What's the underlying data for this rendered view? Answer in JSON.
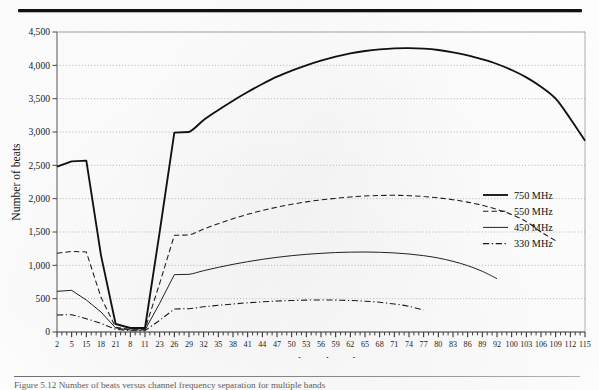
{
  "page": {
    "caption_text": "Figure 5.12 Number of beats versus channel frequency separation for multiple bands"
  },
  "chart_data": {
    "type": "line",
    "title": "",
    "xlabel": "Channel number",
    "ylabel": "Number of beats",
    "ylim": [
      0,
      4500
    ],
    "ytick_labels": [
      "0",
      "500",
      "1,000",
      "1,500",
      "2,000",
      "2,500",
      "3,000",
      "3,500",
      "4,000",
      "4,500"
    ],
    "ytick_values": [
      0,
      500,
      1000,
      1500,
      2000,
      2500,
      3000,
      3500,
      4000,
      4500
    ],
    "grid": "horizontal-dotted",
    "legend_position": "right-middle",
    "xtick_labels": [
      "2",
      "5",
      "15",
      "18",
      "21",
      "8",
      "11",
      "23",
      "26",
      "29",
      "32",
      "35",
      "38",
      "41",
      "44",
      "47",
      "50",
      "53",
      "56",
      "59",
      "62",
      "65",
      "68",
      "71",
      "74",
      "77",
      "80",
      "83",
      "86",
      "89",
      "92",
      "100",
      "103",
      "106",
      "109",
      "112",
      "115"
    ],
    "series": [
      {
        "name": "750 MHz",
        "style": "solid-thick",
        "color": "#111111",
        "points": [
          [
            0,
            2480
          ],
          [
            1,
            2560
          ],
          [
            2,
            2570
          ],
          [
            3,
            1150
          ],
          [
            4,
            120
          ],
          [
            5,
            60
          ],
          [
            6,
            60
          ],
          [
            7,
            1500
          ],
          [
            8,
            2990
          ],
          [
            9,
            3000
          ],
          [
            10,
            3180
          ],
          [
            11,
            3330
          ],
          [
            12,
            3470
          ],
          [
            13,
            3600
          ],
          [
            14,
            3720
          ],
          [
            15,
            3830
          ],
          [
            16,
            3920
          ],
          [
            17,
            4000
          ],
          [
            18,
            4070
          ],
          [
            19,
            4130
          ],
          [
            20,
            4180
          ],
          [
            21,
            4215
          ],
          [
            22,
            4240
          ],
          [
            23,
            4255
          ],
          [
            24,
            4258
          ],
          [
            25,
            4250
          ],
          [
            26,
            4230
          ],
          [
            27,
            4195
          ],
          [
            28,
            4150
          ],
          [
            29,
            4090
          ],
          [
            30,
            4020
          ],
          [
            31,
            3930
          ],
          [
            32,
            3820
          ],
          [
            33,
            3680
          ],
          [
            34,
            3500
          ],
          [
            35,
            3200
          ],
          [
            36,
            2870
          ]
        ]
      },
      {
        "name": "550 MHz",
        "style": "dashed",
        "color": "#1a1a1a",
        "points": [
          [
            0,
            1180
          ],
          [
            1,
            1210
          ],
          [
            2,
            1200
          ],
          [
            3,
            520
          ],
          [
            4,
            70
          ],
          [
            5,
            40
          ],
          [
            6,
            40
          ],
          [
            7,
            730
          ],
          [
            8,
            1450
          ],
          [
            9,
            1455
          ],
          [
            10,
            1545
          ],
          [
            11,
            1625
          ],
          [
            12,
            1700
          ],
          [
            13,
            1765
          ],
          [
            14,
            1822
          ],
          [
            15,
            1872
          ],
          [
            16,
            1915
          ],
          [
            17,
            1952
          ],
          [
            18,
            1982
          ],
          [
            19,
            2005
          ],
          [
            20,
            2025
          ],
          [
            21,
            2040
          ],
          [
            22,
            2048
          ],
          [
            23,
            2050
          ],
          [
            24,
            2045
          ],
          [
            25,
            2032
          ],
          [
            26,
            2012
          ],
          [
            27,
            1985
          ],
          [
            28,
            1948
          ],
          [
            29,
            1900
          ],
          [
            30,
            1840
          ],
          [
            31,
            1762
          ],
          [
            32,
            1655
          ],
          [
            33,
            1500
          ],
          [
            34,
            1370
          ]
        ]
      },
      {
        "name": "450 MHz",
        "style": "solid-thin",
        "color": "#161616",
        "points": [
          [
            0,
            610
          ],
          [
            1,
            625
          ],
          [
            2,
            480
          ],
          [
            3,
            300
          ],
          [
            4,
            60
          ],
          [
            5,
            30
          ],
          [
            6,
            30
          ],
          [
            7,
            430
          ],
          [
            8,
            860
          ],
          [
            9,
            865
          ],
          [
            10,
            920
          ],
          [
            11,
            970
          ],
          [
            12,
            1015
          ],
          [
            13,
            1055
          ],
          [
            14,
            1090
          ],
          [
            15,
            1120
          ],
          [
            16,
            1145
          ],
          [
            17,
            1165
          ],
          [
            18,
            1180
          ],
          [
            19,
            1192
          ],
          [
            20,
            1198
          ],
          [
            21,
            1200
          ],
          [
            22,
            1196
          ],
          [
            23,
            1186
          ],
          [
            24,
            1170
          ],
          [
            25,
            1145
          ],
          [
            26,
            1110
          ],
          [
            27,
            1060
          ],
          [
            28,
            995
          ],
          [
            29,
            910
          ],
          [
            30,
            800
          ]
        ]
      },
      {
        "name": "330 MHz",
        "style": "dash-dot",
        "color": "#1a1a1a",
        "points": [
          [
            0,
            255
          ],
          [
            1,
            260
          ],
          [
            2,
            200
          ],
          [
            3,
            130
          ],
          [
            4,
            40
          ],
          [
            5,
            20
          ],
          [
            6,
            20
          ],
          [
            7,
            175
          ],
          [
            8,
            345
          ],
          [
            9,
            350
          ],
          [
            10,
            378
          ],
          [
            11,
            400
          ],
          [
            12,
            420
          ],
          [
            13,
            438
          ],
          [
            14,
            452
          ],
          [
            15,
            464
          ],
          [
            16,
            472
          ],
          [
            17,
            478
          ],
          [
            18,
            480
          ],
          [
            19,
            478
          ],
          [
            20,
            472
          ],
          [
            21,
            462
          ],
          [
            22,
            445
          ],
          [
            23,
            420
          ],
          [
            24,
            385
          ],
          [
            25,
            330
          ]
        ]
      }
    ]
  },
  "legend": {
    "items": [
      {
        "label": "750 MHz"
      },
      {
        "label": "550 MHz"
      },
      {
        "label": "450 MHz"
      },
      {
        "label": "330 MHz"
      }
    ]
  }
}
